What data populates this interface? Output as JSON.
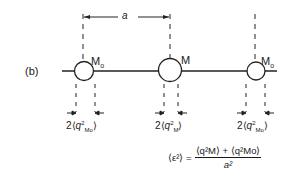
{
  "figure": {
    "part_label": "(b)",
    "spacing_label": "a",
    "nodes": [
      {
        "label": "M",
        "subscript": "o",
        "cx": 84,
        "r": 10
      },
      {
        "label": "M",
        "subscript": "",
        "cx": 170,
        "r": 12
      },
      {
        "label": "M",
        "subscript": "o",
        "cx": 256,
        "r": 10
      }
    ],
    "amplitude_labels": [
      {
        "prefix": "2",
        "q": "q",
        "sup": "2",
        "sub": "M",
        "subsub": "o"
      },
      {
        "prefix": "2",
        "q": "q",
        "sup": "2",
        "sub": "M",
        "subsub": ""
      },
      {
        "prefix": "2",
        "q": "q",
        "sup": "2",
        "sub": "M",
        "subsub": "o"
      }
    ],
    "formula": {
      "lhs": "⟨ε²⟩ =",
      "numerator": "⟨q²M⟩ + ⟨q²Mo⟩",
      "denominator": "a²"
    }
  }
}
